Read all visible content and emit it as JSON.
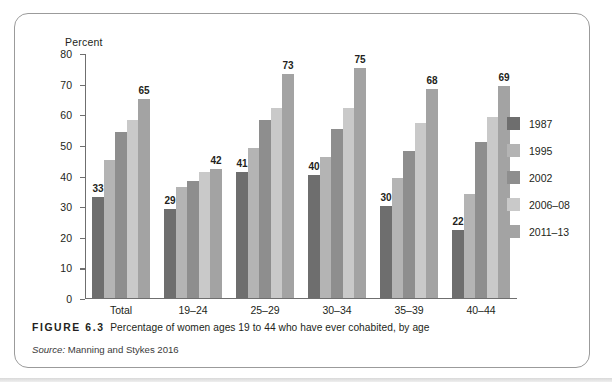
{
  "figure": {
    "number_label": "FIGURE 6.3",
    "caption": "Percentage of women ages 19 to 44 who have ever cohabited, by age",
    "source_word": "Source:",
    "source_text": "Manning and Stykes 2016"
  },
  "axis": {
    "y_title": "Percent",
    "y_ticks": [
      "0",
      "10",
      "20",
      "30",
      "40",
      "50",
      "60",
      "70",
      "80"
    ]
  },
  "legend": {
    "items": [
      {
        "label": "1987",
        "color": "#6e6e6e"
      },
      {
        "label": "1995",
        "color": "#b4b4b4"
      },
      {
        "label": "2002",
        "color": "#8e8e8e"
      },
      {
        "label": "2006-08",
        "color": "#c9c9c9"
      },
      {
        "label": "2011-13",
        "color": "#a3a3a3"
      }
    ]
  },
  "chart_data": {
    "type": "bar",
    "title": "Percentage of women ages 19 to 44 who have ever cohabited, by age",
    "xlabel": "",
    "ylabel": "Percent",
    "ylim": [
      0,
      80
    ],
    "ytick_step": 10,
    "grid": false,
    "legend_position": "right",
    "categories": [
      "Total",
      "19-24",
      "25-29",
      "30-34",
      "35-39",
      "40-44"
    ],
    "series": [
      {
        "name": "1987",
        "color": "#6e6e6e",
        "values": [
          33,
          29,
          41,
          40,
          30,
          22
        ]
      },
      {
        "name": "1995",
        "color": "#b4b4b4",
        "values": [
          45,
          36,
          49,
          46,
          39,
          34
        ]
      },
      {
        "name": "2002",
        "color": "#8e8e8e",
        "values": [
          54,
          38,
          58,
          55,
          48,
          51
        ]
      },
      {
        "name": "2006-08",
        "color": "#c9c9c9",
        "values": [
          58,
          41,
          62,
          62,
          57,
          59
        ]
      },
      {
        "name": "2011-13",
        "color": "#a3a3a3",
        "values": [
          65,
          42,
          73,
          75,
          68,
          69
        ]
      }
    ],
    "data_labels": [
      {
        "category": "Total",
        "series": "1987",
        "value": "33"
      },
      {
        "category": "Total",
        "series": "2011-13",
        "value": "65"
      },
      {
        "category": "19-24",
        "series": "1987",
        "value": "29"
      },
      {
        "category": "19-24",
        "series": "2011-13",
        "value": "42"
      },
      {
        "category": "25-29",
        "series": "1987",
        "value": "41"
      },
      {
        "category": "25-29",
        "series": "2011-13",
        "value": "73"
      },
      {
        "category": "30-34",
        "series": "1987",
        "value": "40"
      },
      {
        "category": "30-34",
        "series": "2011-13",
        "value": "75"
      },
      {
        "category": "35-39",
        "series": "1987",
        "value": "30"
      },
      {
        "category": "35-39",
        "series": "2011-13",
        "value": "68"
      },
      {
        "category": "40-44",
        "series": "1987",
        "value": "22"
      },
      {
        "category": "40-44",
        "series": "2011-13",
        "value": "69"
      }
    ]
  }
}
